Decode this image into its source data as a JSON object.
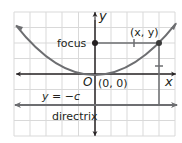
{
  "diagram": {
    "type": "parabola-focus-directrix",
    "labels": {
      "y_axis": "y",
      "x_axis": "x",
      "origin": "O",
      "vertex": "(0, 0)",
      "focus": "focus",
      "point": "(x, y)",
      "directrix_equation": "y = −c",
      "directrix": "directrix"
    },
    "colors": {
      "grid": "#d9d9d9",
      "lines": "#6d6e71",
      "text": "#231f20",
      "point": "#231f20"
    }
  }
}
